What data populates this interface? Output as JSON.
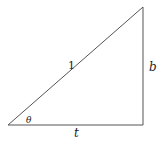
{
  "diagram": {
    "type": "right-triangle",
    "stroke_color": "#555555",
    "vertices": {
      "bottom_left": [
        8,
        125
      ],
      "bottom_right": [
        143,
        125
      ],
      "top_right": [
        143,
        7
      ]
    },
    "labels": {
      "hypotenuse": "1",
      "vertical_side": "b",
      "horizontal_side": "t",
      "angle": "θ"
    }
  }
}
